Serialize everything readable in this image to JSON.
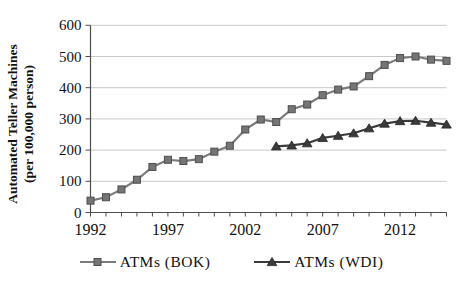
{
  "chart_data": {
    "type": "line",
    "x": [
      1992,
      1993,
      1994,
      1995,
      1996,
      1997,
      1998,
      1999,
      2000,
      2001,
      2002,
      2003,
      2004,
      2005,
      2006,
      2007,
      2008,
      2009,
      2010,
      2011,
      2012,
      2013,
      2014,
      2015
    ],
    "series": [
      {
        "name": "ATMs (BOK)",
        "marker": "square",
        "values": [
          38,
          49,
          74,
          105,
          146,
          169,
          165,
          171,
          195,
          214,
          266,
          298,
          290,
          331,
          346,
          376,
          394,
          404,
          437,
          473,
          495,
          500,
          490,
          486
        ]
      },
      {
        "name": "ATMs (WDI)",
        "marker": "triangle",
        "values": [
          null,
          null,
          null,
          null,
          null,
          null,
          null,
          null,
          null,
          null,
          null,
          null,
          212,
          215,
          222,
          239,
          246,
          254,
          270,
          285,
          293,
          294,
          288,
          282
        ]
      }
    ],
    "title": "",
    "xlabel": "",
    "ylabel_line1": "Automated Teller Machines",
    "ylabel_line2": "(per 100,000 person)",
    "ylim": [
      0,
      600
    ],
    "yticks": [
      0,
      100,
      200,
      300,
      400,
      500,
      600
    ],
    "xticks_labeled": [
      1992,
      1997,
      2002,
      2007,
      2012
    ],
    "grid": "horizontal",
    "legend_position": "bottom",
    "colors": {
      "bok_line": "#7b7b7b",
      "bok_marker_fill": "#757575",
      "bok_marker_edge": "#4e4e4e",
      "wdi_line": "#3b3b3b",
      "wdi_marker_fill": "#3b3b3b",
      "wdi_marker_edge": "#242424",
      "gridline": "#c8c8c8",
      "axis": "#4e4e4e",
      "text": "#111111"
    }
  }
}
